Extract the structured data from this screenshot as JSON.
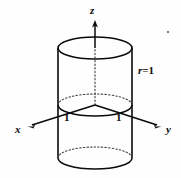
{
  "figure": {
    "background_color": "#fefefe",
    "ink_color": "#0a0a0a",
    "labels": {
      "z_axis": "z",
      "x_axis": "x",
      "y_axis": "y",
      "tick_left": "1",
      "tick_right": "1",
      "radius_symbol": "r",
      "radius_equals": "=",
      "radius_value": "1"
    },
    "geometry": {
      "origin": {
        "x": 95,
        "y": 105
      },
      "ellipse_rx": 37,
      "ellipse_ry": 11,
      "top_ellipse_cy": 48,
      "mid_ellipse_cy": 105,
      "bottom_ellipse_cy": 158,
      "wall_left_x": 58,
      "wall_right_x": 132,
      "z_axis_tip": {
        "x": 95,
        "y": 21
      },
      "x_axis_tip": {
        "x": 28,
        "y": 127
      },
      "y_axis_tip": {
        "x": 161,
        "y": 127
      }
    }
  }
}
